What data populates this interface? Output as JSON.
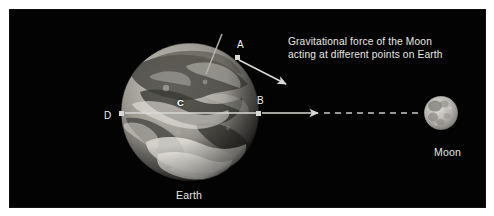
{
  "figure": {
    "background_color": "#ffffff",
    "panel_color": "#030303",
    "accent_color": "#d8d8d4",
    "text_color": "#e8e8e5"
  },
  "caption": {
    "line1": "Gravitational force of the Moon",
    "line2": "acting at different points on Earth"
  },
  "bodies": {
    "earth": {
      "label": "Earth",
      "center_x": 190,
      "center_y": 112,
      "radius": 69
    },
    "moon": {
      "label": "Moon",
      "center_x": 441,
      "center_y": 113,
      "radius": 17
    }
  },
  "points": [
    {
      "id": "A",
      "label": "A",
      "x": 236,
      "y": 57,
      "note": "near-side upper point, force vector angled toward Moon"
    },
    {
      "id": "B",
      "label": "B",
      "x": 259,
      "y": 113,
      "note": "near-side point, strongest force, vector along Earth-Moon line"
    },
    {
      "id": "C",
      "label": "C",
      "x": 190,
      "y": 113,
      "note": "Earth's center"
    },
    {
      "id": "D",
      "label": "D",
      "x": 122,
      "y": 113,
      "note": "far-side point, weakest force"
    }
  ],
  "vectors": [
    {
      "from": "A",
      "x1": 239,
      "y1": 59,
      "x2": 288,
      "y2": 85,
      "style": "solid-arrow"
    },
    {
      "from": "B",
      "x1": 262,
      "y1": 113,
      "x2": 320,
      "y2": 113,
      "style": "solid-arrow"
    },
    {
      "from": "C",
      "x1": 193,
      "y1": 113,
      "x2": 257,
      "y2": 113,
      "style": "solid-line"
    },
    {
      "from": "D",
      "x1": 125,
      "y1": 113,
      "x2": 190,
      "y2": 113,
      "style": "solid-line"
    }
  ],
  "sight_line": {
    "label": "Earth-Moon sight line",
    "x1": 322,
    "y1": 113,
    "x2": 424,
    "y2": 113,
    "style": "dashed"
  },
  "earth_axis": {
    "label": "Earth rotational axis",
    "x1": 222,
    "y1": 34,
    "x2": 206,
    "y2": 74
  }
}
